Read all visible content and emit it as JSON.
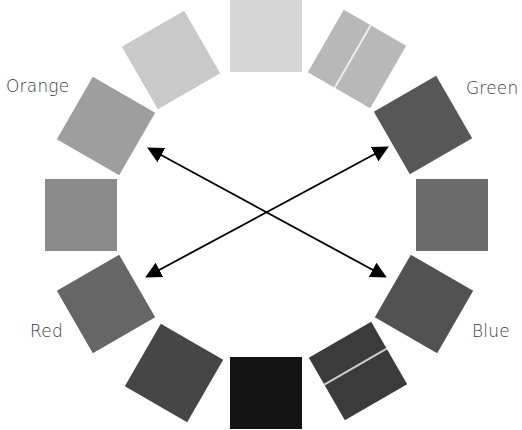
{
  "diagram": {
    "type": "color-wheel",
    "center": [
      266,
      215
    ],
    "swatches": [
      {
        "id": "s0",
        "angle": 0,
        "cx": 266,
        "cy": 36,
        "rotate": 0,
        "color": "#d6d6d6",
        "seam": false
      },
      {
        "id": "s1",
        "angle": 30,
        "cx": 357,
        "cy": 59,
        "rotate": 30,
        "color": "#b8b8b8",
        "seam": true
      },
      {
        "id": "s2",
        "angle": 60,
        "cx": 423,
        "cy": 125,
        "rotate": 60,
        "color": "#575757",
        "seam": false
      },
      {
        "id": "s3",
        "angle": 90,
        "cx": 452,
        "cy": 215,
        "rotate": 0,
        "color": "#6b6b6b",
        "seam": false
      },
      {
        "id": "s4",
        "angle": 120,
        "cx": 424,
        "cy": 304,
        "rotate": 30,
        "color": "#525252",
        "seam": false
      },
      {
        "id": "s5",
        "angle": 150,
        "cx": 358,
        "cy": 371,
        "rotate": 60,
        "color": "#3b3b3b",
        "seam": true
      },
      {
        "id": "s6",
        "angle": 180,
        "cx": 266,
        "cy": 393,
        "rotate": 0,
        "color": "#141414",
        "seam": false
      },
      {
        "id": "s7",
        "angle": 210,
        "cx": 174,
        "cy": 373,
        "rotate": 30,
        "color": "#464646",
        "seam": false
      },
      {
        "id": "s8",
        "angle": 240,
        "cx": 106,
        "cy": 304,
        "rotate": 60,
        "color": "#666666",
        "seam": false
      },
      {
        "id": "s9",
        "angle": 270,
        "cx": 81,
        "cy": 215,
        "rotate": 0,
        "color": "#8a8a8a",
        "seam": false
      },
      {
        "id": "s10",
        "angle": 300,
        "cx": 106,
        "cy": 126,
        "rotate": 30,
        "color": "#9e9e9e",
        "seam": false
      },
      {
        "id": "s11",
        "angle": 330,
        "cx": 171,
        "cy": 60,
        "rotate": 60,
        "color": "#c9c9c9",
        "seam": false
      }
    ],
    "labels": {
      "orange": "Orange",
      "green": "Green",
      "red": "Red",
      "blue": "Blue"
    },
    "arrows": [
      {
        "from": [
          384,
          276
        ],
        "to": [
          150,
          149
        ],
        "double_headed": true,
        "label": "orange-blue"
      },
      {
        "from": [
          148,
          276
        ],
        "to": [
          386,
          148
        ],
        "double_headed": true,
        "label": "red-green"
      }
    ],
    "arrow_color": "#000000"
  }
}
